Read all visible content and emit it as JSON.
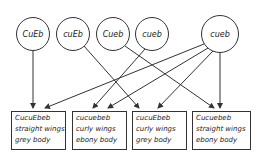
{
  "gametes": [
    {
      "label": "CuEb"
    },
    {
      "label": "cuEb"
    },
    {
      "label": "Cueb"
    },
    {
      "label": "cueb"
    },
    {
      "label": "cueb"
    }
  ],
  "offspring": [
    {
      "genotype": "CucuEbeb",
      "wings": "straight wings",
      "body": "grey body"
    },
    {
      "genotype": "cucuebeb",
      "wings": "curly wings",
      "body": "ebony body"
    },
    {
      "genotype": "cucuEbeb",
      "wings": "curly wings",
      "body": "grey body"
    },
    {
      "genotype": "Cucuebeb",
      "wings": "straight wings",
      "body": "ebony body"
    }
  ],
  "colors": {
    "stroke": "#333333",
    "text": "#222222",
    "background": "#ffffff"
  }
}
